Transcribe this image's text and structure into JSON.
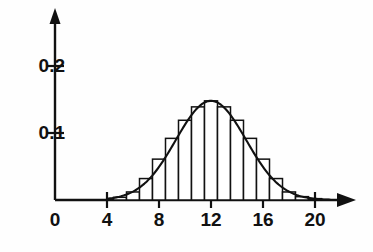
{
  "chart_data": {
    "type": "bar",
    "title": "",
    "subtitle": "",
    "xlabel": "",
    "ylabel": "",
    "xlim": [
      0,
      23
    ],
    "ylim": [
      0,
      0.235
    ],
    "grid": false,
    "legend": null,
    "bin_width": 1,
    "xticks": [
      0,
      4,
      8,
      12,
      16,
      20
    ],
    "xtick_labels": [
      "0",
      "4",
      "8",
      "12",
      "16",
      "20"
    ],
    "yticks": [
      0.1,
      0.2
    ],
    "ytick_labels": [
      "0.1",
      "0.2"
    ],
    "axis_color": "#111111",
    "bar_edge_color": "#111111",
    "bar_fill_color": "#ffffff",
    "curve_color": "#111111",
    "categories": [
      5,
      6,
      7,
      8,
      9,
      10,
      11,
      12,
      13,
      14,
      15,
      16,
      17,
      18,
      19,
      20
    ],
    "values": [
      0.004,
      0.012,
      0.032,
      0.061,
      0.092,
      0.119,
      0.139,
      0.148,
      0.139,
      0.119,
      0.092,
      0.061,
      0.032,
      0.012,
      0.005,
      0.002
    ],
    "overlay_curve": {
      "name": "normal density",
      "type": "line",
      "mean": 12,
      "sigma": 2.7,
      "peak": 0.148,
      "x": [
        4.5,
        5,
        5.5,
        6,
        6.5,
        7,
        7.5,
        8,
        8.5,
        9,
        9.5,
        10,
        10.5,
        11,
        11.5,
        12,
        12.5,
        13,
        13.5,
        14,
        14.5,
        15,
        15.5,
        16,
        16.5,
        17,
        17.5,
        18,
        18.5,
        19,
        19.5,
        20,
        20.5
      ],
      "y": [
        0.002,
        0.005,
        0.009,
        0.016,
        0.026,
        0.039,
        0.055,
        0.074,
        0.093,
        0.111,
        0.127,
        0.138,
        0.145,
        0.148,
        0.148,
        0.148,
        0.148,
        0.148,
        0.145,
        0.138,
        0.127,
        0.111,
        0.093,
        0.074,
        0.055,
        0.039,
        0.026,
        0.016,
        0.009,
        0.005,
        0.002,
        0.001,
        0.0
      ]
    }
  }
}
